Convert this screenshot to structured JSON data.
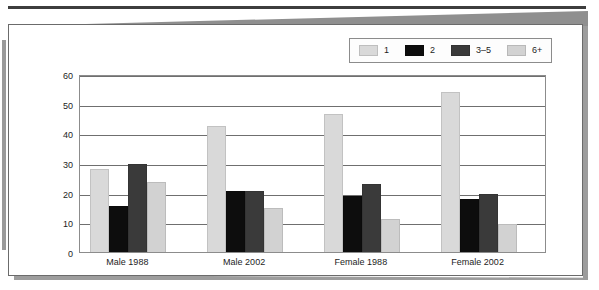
{
  "chart_data": {
    "type": "bar",
    "title": "",
    "subtitle": "",
    "xlabel": "",
    "ylabel": "",
    "categories": [
      "Male 1988",
      "Male 2002",
      "Female 1988",
      "Female 2002"
    ],
    "series": [
      {
        "name": "1",
        "color": "#d9d9d9",
        "values": [
          28.0,
          42.5,
          46.5,
          54.0
        ]
      },
      {
        "name": "2",
        "color": "#0d0d0d",
        "values": [
          15.5,
          20.5,
          19.0,
          18.0
        ]
      },
      {
        "name": "3-5",
        "color": "#3a3a3a",
        "values": [
          29.5,
          20.5,
          23.0,
          19.5
        ]
      },
      {
        "name": "6+",
        "color": "#d2d2d2",
        "values": [
          23.5,
          15.0,
          11.0,
          9.5
        ]
      }
    ],
    "ylim": [
      0,
      60
    ],
    "yticks": [
      0,
      10,
      20,
      30,
      40,
      50,
      60
    ],
    "ytick_labels": [
      "0",
      "10",
      "20",
      "30",
      "40",
      "50",
      "60"
    ],
    "grid": "horizontal",
    "legend_position": "top-right",
    "legend_entries": [
      {
        "label": "1",
        "color": "#d9d9d9"
      },
      {
        "label": "2",
        "color": "#0d0d0d"
      },
      {
        "label": "3–5",
        "color": "#3a3a3a"
      },
      {
        "label": "6+",
        "color": "#d2d2d2"
      }
    ]
  },
  "colors": {
    "frame": "#6b6b6b",
    "gridline": "#6f6f6f",
    "text": "#1d1d1d",
    "background": "#ffffff"
  }
}
